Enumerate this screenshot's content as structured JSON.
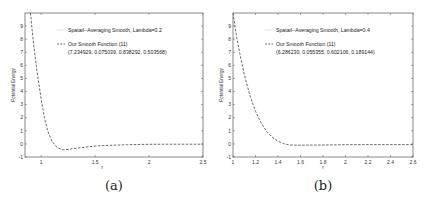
{
  "chart_data": [
    {
      "type": "line",
      "panel_label": "(a)",
      "xlabel": "r",
      "ylabel": "Potential Energy",
      "xlim": [
        0.85,
        2.5
      ],
      "ylim": [
        -1,
        10
      ],
      "xticks": [
        1,
        1.5,
        2,
        2.5
      ],
      "xtick_labels": [
        "1",
        "1.5",
        "2",
        "2.5"
      ],
      "yticks": [
        -1,
        0,
        1,
        2,
        3,
        4,
        5,
        6,
        7,
        8,
        9
      ],
      "ytick_labels": [
        "-1",
        "0",
        "1",
        "2",
        "3",
        "4",
        "5",
        "6",
        "7",
        "8",
        "9"
      ],
      "grid": false,
      "legend_position": "upper right",
      "legend": [
        {
          "label": "Spatail--Averaging Smooth, Lambda=0.2",
          "style": "solid",
          "color": "#d8d8d8"
        },
        {
          "label": "Our Smooth Function (11)",
          "sublabel": "(7.234929, 0.075039, 0.838292, 0.503568)",
          "style": "dashed",
          "color": "#444444"
        }
      ],
      "series": [
        {
          "name": "Our Smooth Function (11)",
          "x": [
            0.9,
            0.93,
            0.96,
            1.0,
            1.03,
            1.06,
            1.1,
            1.15,
            1.2,
            1.25,
            1.3,
            1.4,
            1.5,
            1.6,
            1.7,
            1.8,
            2.0,
            2.2,
            2.5
          ],
          "y": [
            10.0,
            7.6,
            5.6,
            3.4,
            2.0,
            1.0,
            0.2,
            -0.3,
            -0.45,
            -0.42,
            -0.36,
            -0.25,
            -0.17,
            -0.12,
            -0.09,
            -0.06,
            -0.03,
            -0.02,
            -0.02
          ]
        },
        {
          "name": "Spatail--Averaging Smooth, Lambda=0.2",
          "x": [],
          "y": []
        }
      ]
    },
    {
      "type": "line",
      "panel_label": "(b)",
      "xlabel": "r",
      "ylabel": "Potential Energy",
      "xlim": [
        1.0,
        2.6
      ],
      "ylim": [
        -1,
        10
      ],
      "xticks": [
        1,
        1.2,
        1.4,
        1.6,
        1.8,
        2,
        2.2,
        2.4,
        2.6
      ],
      "xtick_labels": [
        "1",
        "1.2",
        "1.4",
        "1.6",
        "1.8",
        "2",
        "2.2",
        "2.4",
        "2.6"
      ],
      "yticks": [
        -1,
        0,
        1,
        2,
        3,
        4,
        5,
        6,
        7,
        8,
        9
      ],
      "ytick_labels": [
        "-1",
        "0",
        "1",
        "2",
        "3",
        "4",
        "5",
        "6",
        "7",
        "8",
        "9"
      ],
      "grid": false,
      "legend_position": "upper right",
      "legend": [
        {
          "label": "Spatail--Averaging Smooth, Lambda=0.4",
          "style": "solid",
          "color": "#d8d8d8"
        },
        {
          "label": "Our Smooth Function (11)",
          "sublabel": "(6.286230, 0.055355, 0.602106, 0.189144)",
          "style": "dashed",
          "color": "#444444"
        }
      ],
      "series": [
        {
          "name": "Our Smooth Function (11)",
          "x": [
            1.0,
            1.03,
            1.06,
            1.1,
            1.15,
            1.2,
            1.25,
            1.3,
            1.35,
            1.4,
            1.45,
            1.5,
            1.55,
            1.6,
            1.8,
            2.0,
            2.2,
            2.4,
            2.6
          ],
          "y": [
            10.0,
            8.3,
            6.9,
            5.3,
            3.7,
            2.5,
            1.6,
            0.95,
            0.5,
            0.2,
            0.02,
            -0.08,
            -0.1,
            -0.1,
            -0.08,
            -0.06,
            -0.05,
            -0.05,
            -0.05
          ]
        },
        {
          "name": "Spatail--Averaging Smooth, Lambda=0.4",
          "x": [],
          "y": []
        }
      ]
    }
  ],
  "captions": [
    "(a)",
    "(b)"
  ]
}
